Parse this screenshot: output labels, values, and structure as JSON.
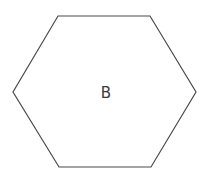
{
  "diagram": {
    "shape": "hexagon",
    "label": "B",
    "stroke_color": "#4a4a4a",
    "fill_color": "#ffffff",
    "vertices": "58,16 150,16 196,92 151,167 59,167 13,92"
  }
}
